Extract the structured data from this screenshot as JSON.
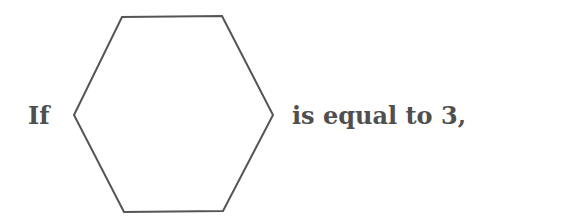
{
  "sentence": {
    "prefix": "If",
    "suffix": "is equal to 3,"
  },
  "shape": {
    "type": "hexagon",
    "stroke": "#555555",
    "fill": "#ffffff",
    "points": "122,17 222,16 273,115 223,211 124,212 74,115"
  },
  "colors": {
    "text": "#4f4f4f",
    "background": "#ffffff"
  }
}
